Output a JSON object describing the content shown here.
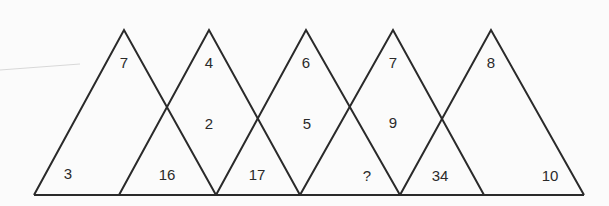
{
  "puzzle": {
    "type": "overlapping-triangles-number-puzzle",
    "triangles": [
      {
        "apex": [
          124,
          30
        ],
        "base": [
          34,
          216
        ]
      },
      {
        "apex": [
          209,
          30
        ],
        "base": [
          119,
          300
        ]
      },
      {
        "apex": [
          306,
          30
        ],
        "base": [
          216,
          400
        ]
      },
      {
        "apex": [
          393,
          30
        ],
        "base": [
          300,
          484
        ]
      },
      {
        "apex": [
          491,
          30
        ],
        "base": [
          400,
          584
        ]
      }
    ],
    "numbers": {
      "t1_top": "7",
      "t1_bottom_left": "3",
      "t2_top": "4",
      "t2_middle": "2",
      "overlap_bottom_1_2": "16",
      "t3_top": "6",
      "t3_middle": "5",
      "overlap_bottom_2_3": "17",
      "t4_top": "7",
      "t4_middle": "9",
      "overlap_bottom_3_4": "?",
      "t5_top": "8",
      "overlap_bottom_4_5": "34",
      "t5_bottom_right": "10"
    },
    "line_color": "#2a2a2a",
    "base_y": 195
  }
}
